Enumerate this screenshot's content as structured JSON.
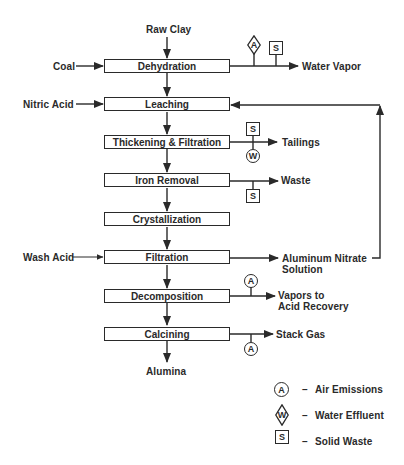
{
  "diagram": {
    "inputs": {
      "raw_clay": "Raw Clay",
      "coal": "Coal",
      "nitric_acid": "Nitric Acid",
      "wash_acid": "Wash Acid"
    },
    "steps": [
      {
        "id": "dehydration",
        "label": "Dehydration"
      },
      {
        "id": "leaching",
        "label": "Leaching"
      },
      {
        "id": "thickening",
        "label": "Thickening & Filtration"
      },
      {
        "id": "iron_removal",
        "label": "Iron Removal"
      },
      {
        "id": "crystallization",
        "label": "Crystallization"
      },
      {
        "id": "filtration",
        "label": "Filtration"
      },
      {
        "id": "decomposition",
        "label": "Decomposition"
      },
      {
        "id": "calcining",
        "label": "Calcining"
      }
    ],
    "outputs": {
      "water_vapor": "Water Vapor",
      "tailings": "Tailings",
      "waste": "Waste",
      "aluminum_nitrate_line1": "Aluminum Nitrate",
      "aluminum_nitrate_line2": "Solution",
      "vapors_line1": "Vapors to",
      "vapors_line2": "Acid Recovery",
      "stack_gas": "Stack Gas",
      "alumina": "Alumina"
    },
    "markers": {
      "a": "A",
      "s": "S",
      "w": "W"
    },
    "legend": [
      {
        "symbol": "A",
        "shape": "circle",
        "dash": "–",
        "label": "Air Emissions"
      },
      {
        "symbol": "W",
        "shape": "diamond",
        "dash": "–",
        "label": "Water Effluent"
      },
      {
        "symbol": "S",
        "shape": "square",
        "dash": "–",
        "label": "Solid Waste"
      }
    ],
    "colors": {
      "ink": "#2a2a2a",
      "background": "#ffffff"
    }
  }
}
